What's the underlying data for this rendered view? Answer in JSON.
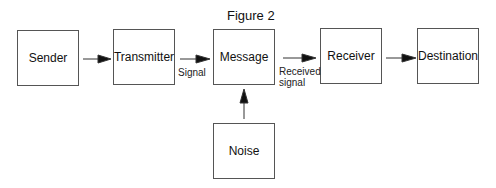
{
  "title": "Figure 2",
  "nodes": {
    "sender": "Sender",
    "transmitter": "Transmitter",
    "message": "Message",
    "receiver": "Receiver",
    "destination": "Destination",
    "noise": "Noise"
  },
  "edges": [
    {
      "from": "Sender",
      "to": "Transmitter",
      "label": ""
    },
    {
      "from": "Transmitter",
      "to": "Message",
      "label": "Signal"
    },
    {
      "from": "Message",
      "to": "Receiver",
      "label": "Received signal"
    },
    {
      "from": "Receiver",
      "to": "Destination",
      "label": ""
    },
    {
      "from": "Noise",
      "to": "Message",
      "label": ""
    }
  ],
  "labels": {
    "signal": "Signal",
    "received_1": "Received",
    "received_2": "signal"
  }
}
